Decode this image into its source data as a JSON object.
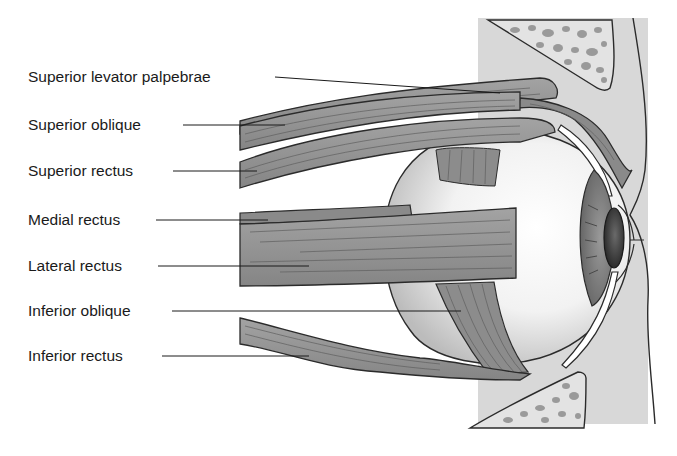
{
  "diagram": {
    "labels": [
      {
        "id": "superior-levator-palpebrae",
        "text": "Superior levator palpebrae",
        "x": 28,
        "y": 68
      },
      {
        "id": "superior-oblique",
        "text": "Superior oblique",
        "x": 28,
        "y": 116
      },
      {
        "id": "superior-rectus",
        "text": "Superior rectus",
        "x": 28,
        "y": 162
      },
      {
        "id": "medial-rectus",
        "text": "Medial rectus",
        "x": 28,
        "y": 211
      },
      {
        "id": "lateral-rectus",
        "text": "Lateral rectus",
        "x": 28,
        "y": 257
      },
      {
        "id": "inferior-oblique",
        "text": "Inferior oblique",
        "x": 28,
        "y": 302
      },
      {
        "id": "inferior-rectus",
        "text": "Inferior rectus",
        "x": 28,
        "y": 347
      }
    ],
    "colors": {
      "muscle": "#8f8f8f",
      "muscle_dark": "#6e6e6e",
      "outline": "#2b2b2b",
      "eyeball": "#e6e6e6",
      "eyeball_shadow": "#bdbdbd",
      "orbit_tissue": "#d6d6d6",
      "bone_spots": "#9a9a9a",
      "iris": "#7d7d7d",
      "lens": "#3a3a3a",
      "background": "#ffffff"
    }
  }
}
